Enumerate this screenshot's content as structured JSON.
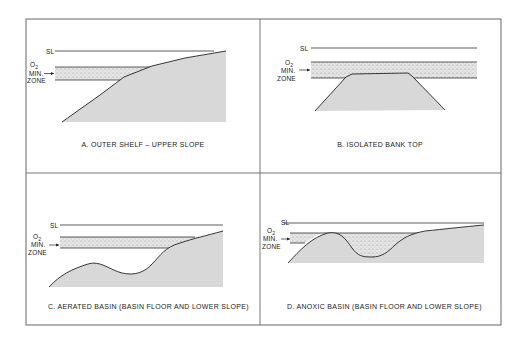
{
  "colors": {
    "frame": "#666666",
    "ink": "#222222",
    "land": "#d9d9d9",
    "zone": "#e4e4e4",
    "stipple": "#555555"
  },
  "labels": {
    "sea_level": "SL",
    "o2": "O",
    "o2_sub": "2",
    "min": "MIN.",
    "zone": "ZONE"
  },
  "panels": [
    {
      "id": "A",
      "caption": "A. OUTER SHELF – UPPER SLOPE"
    },
    {
      "id": "B",
      "caption": "B. ISOLATED BANK TOP"
    },
    {
      "id": "C",
      "caption": "C. AERATED BASIN (BASIN FLOOR AND LOWER SLOPE)"
    },
    {
      "id": "D",
      "caption": "D. ANOXIC BASIN (BASIN FLOOR AND LOWER SLOPE)"
    }
  ]
}
